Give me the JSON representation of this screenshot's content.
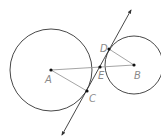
{
  "diagram": {
    "type": "geometry",
    "colors": {
      "circle": "#333333",
      "segment": "#9a9a9a",
      "line": "#333333",
      "point": "#111111",
      "label": "#8a8a8a"
    },
    "circles": [
      {
        "name": "circle-A",
        "center": "A",
        "cx": 51,
        "cy": 70,
        "r": 41
      },
      {
        "name": "circle-B",
        "center": "B",
        "cx": 134,
        "cy": 65,
        "r": 29
      }
    ],
    "points": [
      {
        "id": "A",
        "label": "A",
        "x": 51,
        "y": 70,
        "lx": 45,
        "ly": 83
      },
      {
        "id": "B",
        "label": "B",
        "x": 134,
        "y": 65,
        "lx": 134,
        "ly": 79
      },
      {
        "id": "C",
        "label": "C",
        "x": 87,
        "y": 91,
        "lx": 89,
        "ly": 102
      },
      {
        "id": "D",
        "label": "D",
        "x": 109,
        "y": 49,
        "lx": 100,
        "ly": 52
      },
      {
        "id": "E",
        "label": "E",
        "x": 100,
        "y": 67,
        "lx": 98,
        "ly": 79
      }
    ],
    "segments": [
      {
        "from": "A",
        "to": "B"
      },
      {
        "from": "A",
        "to": "C"
      },
      {
        "from": "B",
        "to": "D"
      }
    ],
    "tangent_line": {
      "x1": 62,
      "y1": 135,
      "x2": 131,
      "y2": 10,
      "arrows": "both"
    }
  }
}
